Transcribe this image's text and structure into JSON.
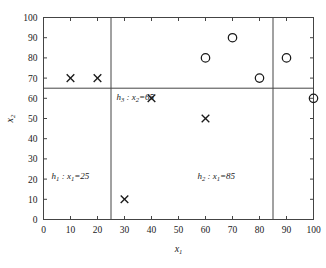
{
  "chart_data": {
    "type": "scatter",
    "title": "",
    "xlabel": "x1",
    "ylabel": "x2",
    "xlim": [
      0,
      100
    ],
    "ylim": [
      0,
      100
    ],
    "xticks": [
      0,
      10,
      20,
      30,
      40,
      50,
      60,
      70,
      80,
      90,
      100
    ],
    "yticks": [
      0,
      10,
      20,
      30,
      40,
      50,
      60,
      70,
      80,
      90,
      100
    ],
    "grid": false,
    "legend": "none",
    "series": [
      {
        "name": "circle",
        "marker": "circle",
        "points": [
          {
            "x": 60,
            "y": 80
          },
          {
            "x": 70,
            "y": 90
          },
          {
            "x": 80,
            "y": 70
          },
          {
            "x": 90,
            "y": 80
          },
          {
            "x": 100,
            "y": 60
          }
        ]
      },
      {
        "name": "cross",
        "marker": "x",
        "points": [
          {
            "x": 10,
            "y": 70
          },
          {
            "x": 20,
            "y": 70
          },
          {
            "x": 30,
            "y": 10
          },
          {
            "x": 40,
            "y": 60
          },
          {
            "x": 60,
            "y": 50
          }
        ]
      }
    ],
    "decision_lines": [
      {
        "id": "h1",
        "orientation": "vertical",
        "value": 25,
        "label_main": "h",
        "label_sub": "1",
        "label_var": "x",
        "label_varsub": "1",
        "label_value": "25"
      },
      {
        "id": "h2",
        "orientation": "vertical",
        "value": 85,
        "label_main": "h",
        "label_sub": "2",
        "label_var": "x",
        "label_varsub": "1",
        "label_value": "85"
      },
      {
        "id": "h3",
        "orientation": "horizontal",
        "value": 65,
        "label_main": "h",
        "label_sub": "3",
        "label_var": "x",
        "label_varsub": "2",
        "label_value": "65"
      }
    ],
    "annotations": [
      {
        "id": "h3",
        "text": "h3 : x2=65",
        "x": 27,
        "y": 59
      },
      {
        "id": "h1",
        "text": "h1 : x1=25",
        "x": 3,
        "y": 20
      },
      {
        "id": "h2",
        "text": "h2 : x1=85",
        "x": 57,
        "y": 20
      }
    ]
  },
  "axis": {
    "x_title_main": "x",
    "x_title_sub": "1",
    "y_title_main": "x",
    "y_title_sub": "2",
    "x_tick_labels": [
      "0",
      "10",
      "20",
      "30",
      "40",
      "50",
      "60",
      "70",
      "80",
      "90",
      "100"
    ],
    "y_tick_labels": [
      "0",
      "10",
      "20",
      "30",
      "40",
      "50",
      "60",
      "70",
      "80",
      "90",
      "100"
    ]
  },
  "colors": {
    "frame": "#444444",
    "marker": "#1a1a1a",
    "background": "#ffffff"
  }
}
